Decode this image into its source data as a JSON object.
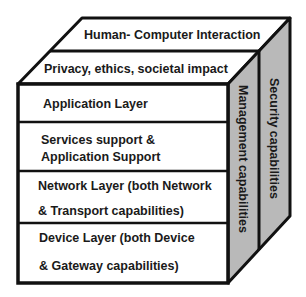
{
  "diagram": {
    "type": "3d-layered-cube",
    "colors": {
      "front_face": "#ffffff",
      "top_face": "#ffffff",
      "side_face": "#b9b9b9",
      "stroke": "#111111",
      "text": "#1a1a1a"
    },
    "top_layers": [
      {
        "label": "Human- Computer Interaction"
      },
      {
        "label": "Privacy, ethics, societal impact"
      }
    ],
    "front_layers": [
      {
        "lines": [
          "Application Layer"
        ]
      },
      {
        "lines": [
          "Services support &",
          "Application Support"
        ]
      },
      {
        "lines": [
          "Network Layer (both Network",
          "& Transport capabilities)"
        ]
      },
      {
        "lines": [
          "Device Layer (both Device",
          "& Gateway capabilities)"
        ]
      }
    ],
    "side_layers": [
      {
        "label": "Management capabilities"
      },
      {
        "label": "Security capabilities"
      }
    ]
  }
}
